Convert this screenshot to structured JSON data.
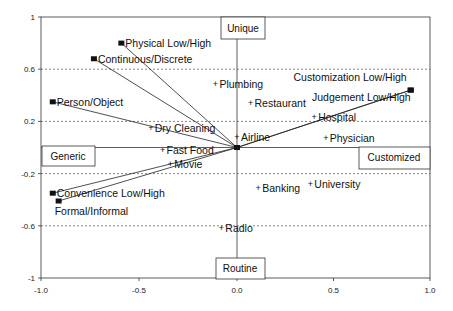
{
  "chart_data": {
    "type": "scatter",
    "title": "",
    "xlabel": "",
    "ylabel": "",
    "xlim": [
      -1.0,
      1.0
    ],
    "ylim": [
      -1,
      1
    ],
    "x_ticks": [
      "-1.0",
      "-0.5",
      "0.0",
      "0.5",
      "1.0"
    ],
    "x_tick_values": [
      -1.0,
      -0.5,
      0.0,
      0.5,
      1.0
    ],
    "y_ticks": [
      "1",
      "0.6",
      "0.2",
      "-0.2",
      "-0.6",
      "-1"
    ],
    "y_tick_values": [
      1,
      0.6,
      0.2,
      -0.2,
      -0.6,
      -1
    ],
    "grid": "dashed horizontal at y ticks",
    "quadrant_labels": {
      "top": "Unique",
      "bottom": "Routine",
      "left": "Generic",
      "right": "Customized"
    },
    "series": [
      {
        "name": "Attributes (vectors)",
        "marker": "square",
        "points": [
          {
            "label": "Physical Low/High",
            "x": -0.59,
            "y": 0.8
          },
          {
            "label": "Continuous/Discrete",
            "x": -0.73,
            "y": 0.68
          },
          {
            "label": "Person/Object",
            "x": -0.94,
            "y": 0.35
          },
          {
            "label": "Customization Low/High",
            "x": 0.9,
            "y": 0.44
          },
          {
            "label": "Judgement Low/High",
            "x": 0.9,
            "y": 0.44
          },
          {
            "label": "Convenience Low/High",
            "x": -0.94,
            "y": -0.35
          },
          {
            "label": "Formal/Informal",
            "x": -0.91,
            "y": -0.41
          }
        ]
      },
      {
        "name": "Services",
        "marker": "plus",
        "points": [
          {
            "label": "Plumbing",
            "x": -0.11,
            "y": 0.49
          },
          {
            "label": "Restaurant",
            "x": 0.07,
            "y": 0.34
          },
          {
            "label": "Hospital",
            "x": 0.4,
            "y": 0.23
          },
          {
            "label": "Dry Cleaning",
            "x": -0.44,
            "y": 0.15
          },
          {
            "label": "Airline",
            "x": 0.0,
            "y": 0.08
          },
          {
            "label": "Physician",
            "x": 0.46,
            "y": 0.07
          },
          {
            "label": "Fast Food",
            "x": -0.38,
            "y": -0.02
          },
          {
            "label": "Movie",
            "x": -0.34,
            "y": -0.13
          },
          {
            "label": "Banking",
            "x": 0.11,
            "y": -0.31
          },
          {
            "label": "University",
            "x": 0.38,
            "y": -0.28
          },
          {
            "label": "Radio",
            "x": -0.08,
            "y": -0.62
          }
        ]
      }
    ]
  }
}
